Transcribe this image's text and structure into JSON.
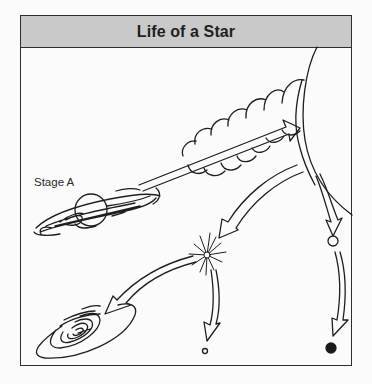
{
  "figure": {
    "title": "Life of a Star",
    "labels": {
      "stage_a": "Stage A"
    },
    "stages": [
      {
        "id": "stage-a",
        "depiction": "nebula / protostar with disk",
        "label": "Stage A"
      },
      {
        "id": "main-sequence-to-giant",
        "depiction": "expanding star sequence"
      },
      {
        "id": "red-giant",
        "depiction": "large star arc at top right"
      },
      {
        "id": "supernova",
        "depiction": "starburst explosion"
      },
      {
        "id": "black-hole",
        "depiction": "spiral accretion disk"
      },
      {
        "id": "neutron-star",
        "depiction": "small open circle"
      },
      {
        "id": "white-dwarf",
        "depiction": "small open circle"
      },
      {
        "id": "black-dwarf",
        "depiction": "filled black circle"
      }
    ],
    "colors": {
      "header_bg": "#c9c9c9",
      "stroke": "#1e1e1e",
      "background": "#fbfbfb"
    }
  }
}
